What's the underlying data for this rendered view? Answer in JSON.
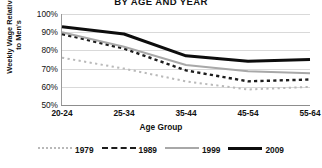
{
  "chart_data": {
    "type": "line",
    "title": "BY AGE AND YEAR",
    "xlabel": "Age Group",
    "ylabel_line1": "Weekly Wage Relative",
    "ylabel_line2": "to Men's",
    "categories": [
      "20-24",
      "25-34",
      "35-44",
      "45-54",
      "55-64"
    ],
    "ylim": [
      50,
      100
    ],
    "yticks": [
      "50%",
      "60%",
      "70%",
      "80%",
      "90%",
      "100%"
    ],
    "ytick_values": [
      50,
      60,
      70,
      80,
      90,
      100
    ],
    "grid": true,
    "legend_position": "bottom",
    "series": [
      {
        "name": "1979",
        "values": [
          76,
          70,
          63,
          58.5,
          60
        ],
        "color": "#b9b9b9",
        "style": "dotted",
        "width": 2
      },
      {
        "name": "1989",
        "values": [
          89,
          81,
          69,
          63,
          64
        ],
        "color": "#1c1c1c",
        "style": "dashed",
        "width": 2.4
      },
      {
        "name": "1999",
        "values": [
          90,
          82,
          72,
          68.5,
          67.5
        ],
        "color": "#a8a8a8",
        "style": "solid",
        "width": 2
      },
      {
        "name": "2009",
        "values": [
          93,
          89,
          77,
          74,
          75
        ],
        "color": "#0d0d0d",
        "style": "solid",
        "width": 3
      }
    ]
  },
  "colors": {
    "grid": "#d9d9d9",
    "axis": "#8d8d8d",
    "text": "#111111",
    "background": "#ffffff"
  }
}
